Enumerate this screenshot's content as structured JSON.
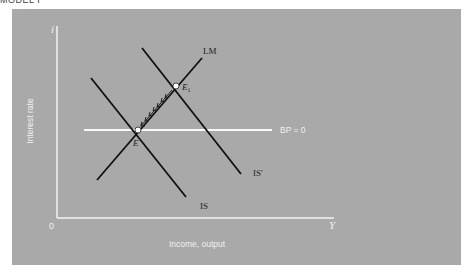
{
  "caption": "MODEL I",
  "diagram": {
    "y_axis_symbol": "i",
    "y_axis_label": "Interest rate",
    "x_axis_symbol": "Y",
    "x_axis_label": "Income, output",
    "origin_label": "0",
    "curves": {
      "lm": "LM",
      "is": "IS",
      "is_shifted": "IS'",
      "bp": "BP = 0"
    },
    "points": {
      "e": "E",
      "e1": "E",
      "e1_sub": "1"
    },
    "colors": {
      "panel": "#a9a9a9",
      "axes": "#f4f4f4",
      "curves": "#111111",
      "bp_line": "#f8f8f8"
    }
  }
}
